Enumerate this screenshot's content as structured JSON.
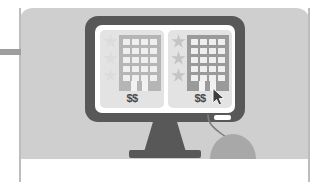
{
  "illustration": {
    "title": "Hotel price comparison on desktop computer",
    "scene_label": "desktop-monitor-with-two-hotel-listings"
  },
  "background": {
    "panel_color": "#cfcfcf",
    "wall_bar_color": "#9e9e9e",
    "wall_bar_label": "wall-trim-bar"
  },
  "monitor": {
    "bezel_color": "#585858",
    "screen_color": "#ffffff",
    "stand_label": "monitor-stand",
    "led_label": "bezel-indicator"
  },
  "mouse": {
    "body_color": "#a8a8a8",
    "cable_color": "#7d7d7d",
    "label": "computer-mouse"
  },
  "cursor": {
    "label": "mouse-pointer",
    "color": "#3d3d3d"
  },
  "screen": {
    "cards": [
      {
        "id": "listing-left",
        "price": "$$",
        "rating_filled": 0,
        "rating_total": 3,
        "building_tone": "light",
        "selected": false,
        "star_on_color": "#c4c4c4",
        "star_off_color": "#dcdcdc",
        "building_color": "#b5b5b5",
        "card_color": "#e3e3e3",
        "window_color": "#efefef",
        "window_cols": 4,
        "window_rows": 5
      },
      {
        "id": "listing-right",
        "price": "$$",
        "rating_filled": 3,
        "rating_total": 3,
        "building_tone": "dark",
        "selected": true,
        "star_on_color": "#c4c4c4",
        "star_off_color": "#dcdcdc",
        "building_color": "#9a9a9a",
        "card_color": "#e3e3e3",
        "window_color": "#efefef",
        "window_cols": 4,
        "window_rows": 5
      }
    ]
  }
}
